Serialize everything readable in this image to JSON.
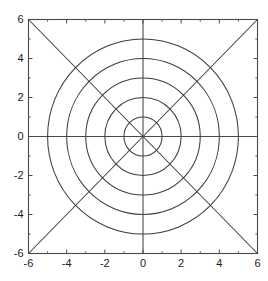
{
  "figure": {
    "background_color": "#ffffff",
    "line_color": "#3d3d3d",
    "axis_color": "#4a4a4a",
    "text_color": "#1a1a1a",
    "width": 268,
    "height": 281
  },
  "chart_data": {
    "type": "line",
    "title": "",
    "xlabel": "",
    "ylabel": "",
    "xlim": [
      -6,
      6
    ],
    "ylim": [
      -6,
      6
    ],
    "grid": false,
    "legend": null,
    "aspect": "equal",
    "xticks": [
      -6,
      -4,
      -2,
      0,
      2,
      4,
      6
    ],
    "yticks": [
      -6,
      -4,
      -2,
      0,
      2,
      4,
      6
    ],
    "xticklabels": [
      "-6",
      "-4",
      "-2",
      "0",
      "2",
      "4",
      "6"
    ],
    "yticklabels": [
      "-6",
      "-4",
      "-2",
      "0",
      "2",
      "4",
      "6"
    ],
    "minor_xticks": [
      -5,
      -3,
      -1,
      1,
      3,
      5
    ],
    "minor_yticks": [
      -5,
      -3,
      -1,
      1,
      3,
      5
    ],
    "series": [
      {
        "name": "circle-r1",
        "shape": "circle",
        "center": [
          0,
          0
        ],
        "radius": 1
      },
      {
        "name": "circle-r2",
        "shape": "circle",
        "center": [
          0,
          0
        ],
        "radius": 2
      },
      {
        "name": "circle-r3",
        "shape": "circle",
        "center": [
          0,
          0
        ],
        "radius": 3
      },
      {
        "name": "circle-r4",
        "shape": "circle",
        "center": [
          0,
          0
        ],
        "radius": 4
      },
      {
        "name": "circle-r5",
        "shape": "circle",
        "center": [
          0,
          0
        ],
        "radius": 5
      },
      {
        "name": "diagonal-up",
        "shape": "line",
        "points": [
          [
            -6,
            -6
          ],
          [
            6,
            6
          ]
        ]
      },
      {
        "name": "diagonal-down",
        "shape": "line",
        "points": [
          [
            -6,
            6
          ],
          [
            6,
            -6
          ]
        ]
      },
      {
        "name": "axis-horizontal",
        "shape": "line",
        "points": [
          [
            -6,
            0
          ],
          [
            6,
            0
          ]
        ]
      },
      {
        "name": "axis-vertical",
        "shape": "line",
        "points": [
          [
            0,
            -6
          ],
          [
            0,
            6
          ]
        ]
      }
    ]
  }
}
